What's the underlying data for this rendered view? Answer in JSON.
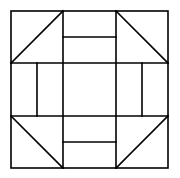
{
  "diagram": {
    "type": "quilt-block",
    "stroke_color": "#000000",
    "background": "#ffffff",
    "outer_square": {
      "x": 11,
      "y": 11,
      "w": 157,
      "h": 157
    },
    "grid_lines": {
      "vertical_x": [
        63,
        116
      ],
      "horizontal_y": [
        63,
        116
      ]
    },
    "dividers": [
      {
        "name": "top-middle-divider",
        "x1": 63,
        "y1": 37,
        "x2": 116,
        "y2": 37
      },
      {
        "name": "bottom-middle-divider",
        "x1": 63,
        "y1": 142,
        "x2": 116,
        "y2": 142
      },
      {
        "name": "left-middle-divider",
        "x1": 37,
        "y1": 63,
        "x2": 37,
        "y2": 116
      },
      {
        "name": "right-middle-divider",
        "x1": 142,
        "y1": 63,
        "x2": 142,
        "y2": 116
      }
    ],
    "diagonals": [
      {
        "name": "top-left-diagonal",
        "x1": 11,
        "y1": 63,
        "x2": 63,
        "y2": 11
      },
      {
        "name": "top-right-diagonal",
        "x1": 116,
        "y1": 11,
        "x2": 168,
        "y2": 63
      },
      {
        "name": "bottom-left-diagonal",
        "x1": 11,
        "y1": 116,
        "x2": 63,
        "y2": 168
      },
      {
        "name": "bottom-right-diagonal",
        "x1": 116,
        "y1": 168,
        "x2": 168,
        "y2": 116
      }
    ]
  }
}
